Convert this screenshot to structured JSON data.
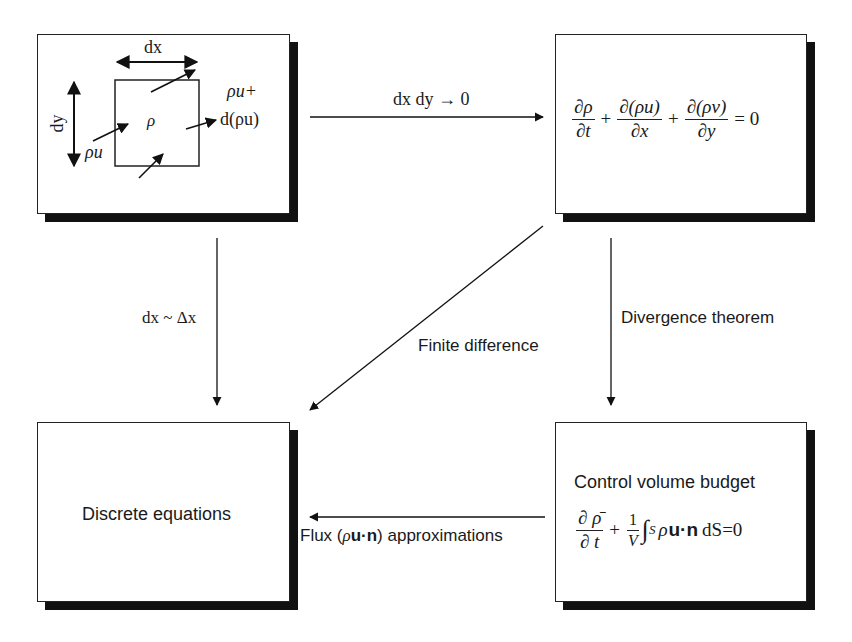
{
  "diagram": {
    "nodes": {
      "control_element": {
        "label_dx": "dx",
        "label_dy": "dy",
        "label_rho": "ρ",
        "label_inflow": "ρu",
        "label_outflow_line1": "ρu+",
        "label_outflow_line2": "d(ρu)"
      },
      "continuity_equation": {
        "term1_num": "∂ρ",
        "term1_den": "∂t",
        "plus1": "+",
        "term2_num": "∂(ρu)",
        "term2_den": "∂x",
        "plus2": "+",
        "term3_num": "∂(ρv)",
        "term3_den": "∂y",
        "equals": "= 0"
      },
      "discrete_equations": {
        "title": "Discrete equations"
      },
      "control_volume_budget": {
        "title": "Control volume budget",
        "term1_num": "∂ ρ̄",
        "term1_den": "∂ t",
        "plus": "+",
        "coef_num": "1",
        "coef_den": "V",
        "integral": "∫",
        "integral_sub": "S",
        "integrand_rho": "ρ",
        "integrand_vec": "u·n",
        "differential": "dS",
        "equals": "=0"
      }
    },
    "edges": {
      "limit": {
        "label": "dx dy → 0",
        "from": "control_element",
        "to": "continuity_equation"
      },
      "discretize": {
        "label": "dx ~ Δx",
        "from": "control_element",
        "to": "discrete_equations"
      },
      "finite_difference": {
        "label": "Finite difference",
        "from": "continuity_equation",
        "to": "discrete_equations"
      },
      "divergence": {
        "label": "Divergence theorem",
        "from": "continuity_equation",
        "to": "control_volume_budget"
      },
      "flux": {
        "label_prefix": "Flux (",
        "label_rho": "ρ",
        "label_vec": "u·n",
        "label_suffix": ") approximations",
        "from": "control_volume_budget",
        "to": "discrete_equations"
      }
    }
  }
}
